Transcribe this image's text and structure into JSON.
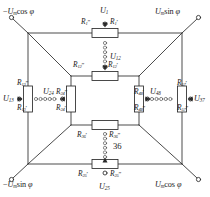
{
  "figure": {
    "type": "electrical-circuit-diagram",
    "annotation_number": "36"
  },
  "terminals": [
    {
      "id": "tl",
      "label_html": "−Uₘcos φ",
      "base": "−U",
      "sub": "m",
      "fn": "cos",
      "arg": "φ",
      "position": "top-left"
    },
    {
      "id": "tr",
      "label_html": "Uₘsin φ",
      "base": "U",
      "sub": "m",
      "fn": "sin",
      "arg": "φ",
      "position": "top-right"
    },
    {
      "id": "bl",
      "label_html": "−Uₘsin φ",
      "base": "−U",
      "sub": "m",
      "fn": "sin",
      "arg": "φ",
      "position": "bottom-left"
    },
    {
      "id": "br",
      "label_html": "Uₘcos φ",
      "base": "U",
      "sub": "m",
      "fn": "cos",
      "arg": "φ",
      "position": "bottom-right"
    }
  ],
  "voltages": [
    {
      "name": "U1",
      "base": "U",
      "sub": "1",
      "location": "top-outer"
    },
    {
      "name": "U12",
      "base": "U",
      "sub": "12",
      "location": "top-inner"
    },
    {
      "name": "U13",
      "base": "U",
      "sub": "13",
      "location": "left-outer"
    },
    {
      "name": "U24",
      "base": "U",
      "sub": "24",
      "location": "left-inner"
    },
    {
      "name": "U48",
      "base": "U",
      "sub": "48",
      "location": "right-inner"
    },
    {
      "name": "U37",
      "base": "U",
      "sub": "37",
      "location": "right-outer"
    },
    {
      "name": "U25",
      "base": "U",
      "sub": "25",
      "location": "bottom-outer"
    }
  ],
  "resistors": [
    {
      "id": "r1",
      "orientation": "horizontal",
      "location": "top-outer",
      "labels": [
        {
          "base": "R",
          "sub": "1",
          "prime": "″",
          "side": "left"
        },
        {
          "base": "R",
          "sub": "1",
          "prime": "′",
          "side": "right"
        }
      ]
    },
    {
      "id": "r12",
      "orientation": "horizontal",
      "location": "top-inner",
      "labels": [
        {
          "base": "R",
          "sub": "12",
          "prime": "″",
          "side": "left"
        },
        {
          "base": "R",
          "sub": "12",
          "prime": "′",
          "side": "right"
        }
      ]
    },
    {
      "id": "r13",
      "orientation": "vertical",
      "location": "left-outer",
      "labels": [
        {
          "base": "R",
          "sub": "13",
          "prime": "″",
          "side": "top"
        },
        {
          "base": "R",
          "sub": "13",
          "prime": "′",
          "side": "bottom"
        }
      ]
    },
    {
      "id": "r24",
      "orientation": "vertical",
      "location": "left-inner",
      "labels": [
        {
          "base": "R",
          "sub": "24",
          "prime": "″",
          "side": "top"
        },
        {
          "base": "R",
          "sub": "24",
          "prime": "′",
          "side": "bottom"
        }
      ]
    },
    {
      "id": "r48",
      "orientation": "vertical",
      "location": "right-inner",
      "labels": [
        {
          "base": "R",
          "sub": "48",
          "prime": "′",
          "side": "top"
        },
        {
          "base": "R",
          "sub": "48",
          "prime": "″",
          "side": "bottom"
        }
      ]
    },
    {
      "id": "r57",
      "orientation": "vertical",
      "location": "right-outer",
      "labels": [
        {
          "base": "R",
          "sub": "57",
          "prime": "′",
          "side": "top"
        },
        {
          "base": "R",
          "sub": "57",
          "prime": "″",
          "side": "bottom"
        }
      ]
    },
    {
      "id": "r36",
      "orientation": "horizontal",
      "location": "bottom-inner",
      "labels": [
        {
          "base": "R",
          "sub": "36",
          "prime": "′",
          "side": "left"
        },
        {
          "base": "R",
          "sub": "36",
          "prime": "″",
          "side": "right"
        }
      ]
    },
    {
      "id": "r25",
      "orientation": "horizontal",
      "location": "bottom-outer",
      "labels": [
        {
          "base": "R",
          "sub": "25",
          "prime": "′",
          "side": "left"
        },
        {
          "base": "R",
          "sub": "25",
          "prime": "″",
          "side": "right"
        }
      ]
    }
  ],
  "labels": {
    "t_tl_minus": "−",
    "t_tl_U": "U",
    "t_tl_sub": "m",
    "t_tl_fn": "cos",
    "t_tl_phi": "φ",
    "t_tr_U": "U",
    "t_tr_sub": "m",
    "t_tr_fn": "sin",
    "t_tr_phi": "φ",
    "t_bl_minus": "−",
    "t_bl_U": "U",
    "t_bl_sub": "m",
    "t_bl_fn": "sin",
    "t_bl_phi": "φ",
    "t_br_U": "U",
    "t_br_sub": "m",
    "t_br_fn": "cos",
    "t_br_phi": "φ",
    "annotation_36": "36",
    "U": "U",
    "R": "R",
    "s1": "1",
    "s12": "12",
    "s13": "13",
    "s24": "24",
    "s25": "25",
    "s36": "36",
    "s37": "37",
    "s48": "48",
    "s57": "57",
    "prime_single": "′",
    "prime_double": "″"
  },
  "colors": {
    "ink": "#1a1a1a",
    "wire": "#2a2a2a",
    "background": "#ffffff",
    "node_fill": "#ffffff"
  }
}
